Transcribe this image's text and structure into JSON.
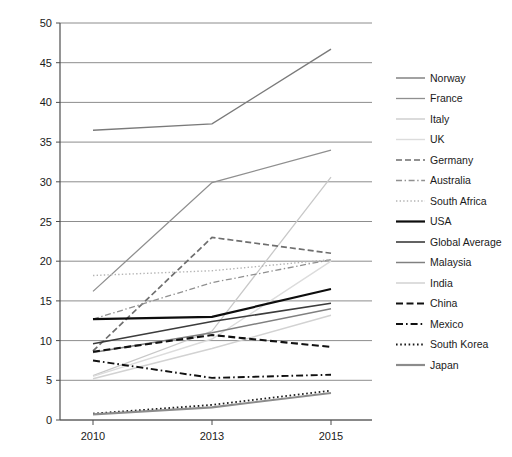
{
  "chart_data": {
    "type": "line",
    "title": "",
    "xlabel": "",
    "ylabel": "",
    "categories": [
      "2010",
      "2013",
      "2015"
    ],
    "x": [
      2010,
      2013,
      2015
    ],
    "ylim": [
      0,
      50
    ],
    "yticks": [
      0,
      5,
      10,
      15,
      20,
      25,
      30,
      35,
      40,
      45,
      50
    ],
    "ytick_labels": [
      "0",
      "5",
      "10",
      "15",
      "20",
      "25",
      "30",
      "35",
      "40",
      "45",
      "50"
    ],
    "xtick_labels": [
      "2010",
      "2013",
      "2015"
    ],
    "grid": "horizontal",
    "legend_position": "right",
    "series": [
      {
        "name": "Norway",
        "values": [
          36.5,
          37.3,
          46.7
        ],
        "color": "#7a7a7a",
        "style": "solid",
        "width": 1.4
      },
      {
        "name": "France",
        "values": [
          16.2,
          29.9,
          34.0
        ],
        "color": "#8f8f8f",
        "style": "solid",
        "width": 1.3
      },
      {
        "name": "Italy",
        "values": [
          5.6,
          11.2,
          30.6
        ],
        "color": "#c8c8c8",
        "style": "solid",
        "width": 1.3
      },
      {
        "name": "UK",
        "values": [
          5.5,
          10.2,
          20.0
        ],
        "color": "#dcdcdc",
        "style": "solid",
        "width": 1.4
      },
      {
        "name": "Germany",
        "values": [
          8.7,
          23.0,
          21.0
        ],
        "color": "#6e6e6e",
        "style": "dashed",
        "width": 1.7
      },
      {
        "name": "Australia",
        "values": [
          12.7,
          17.3,
          20.2
        ],
        "color": "#909090",
        "style": "dashdot",
        "width": 1.3
      },
      {
        "name": "South Africa",
        "values": [
          18.2,
          18.8,
          20.2
        ],
        "color": "#b4b4b4",
        "style": "dotted",
        "width": 1.4
      },
      {
        "name": "USA",
        "values": [
          12.7,
          13.0,
          16.5
        ],
        "color": "#0d0d0d",
        "style": "solid",
        "width": 2.2
      },
      {
        "name": "Global Average",
        "values": [
          9.6,
          12.4,
          14.7
        ],
        "color": "#3c3c3c",
        "style": "solid",
        "width": 1.6
      },
      {
        "name": "Malaysia",
        "values": [
          8.5,
          11.0,
          14.0
        ],
        "color": "#808080",
        "style": "solid",
        "width": 1.5
      },
      {
        "name": "India",
        "values": [
          5.2,
          9.0,
          13.2
        ],
        "color": "#d2d2d2",
        "style": "solid",
        "width": 1.5
      },
      {
        "name": "China",
        "values": [
          8.6,
          10.7,
          9.2
        ],
        "color": "#111111",
        "style": "dashed",
        "width": 2.1
      },
      {
        "name": "Mexico",
        "values": [
          7.5,
          5.3,
          5.7
        ],
        "color": "#111111",
        "style": "dashdot",
        "width": 1.9
      },
      {
        "name": "South Korea",
        "values": [
          0.8,
          1.9,
          3.7
        ],
        "color": "#1a1a1a",
        "style": "dotted",
        "width": 1.9
      },
      {
        "name": "Japan",
        "values": [
          0.7,
          1.6,
          3.4
        ],
        "color": "#8c8c8c",
        "style": "solid",
        "width": 2.2
      }
    ]
  },
  "legend": {
    "items": [
      "Norway",
      "France",
      "Italy",
      "UK",
      "Germany",
      "Australia",
      "South Africa",
      "USA",
      "Global Average",
      "Malaysia",
      "India",
      "China",
      "Mexico",
      "South Korea",
      "Japan"
    ]
  },
  "axes": {
    "y_tick_labels": [
      "50",
      "45",
      "40",
      "35",
      "30",
      "25",
      "20",
      "15",
      "10",
      "5",
      "0"
    ],
    "x_tick_labels": [
      "2010",
      "2013",
      "2015"
    ]
  },
  "colors": {
    "background": "#ffffff",
    "gridline": "#808080",
    "axis": "#4d4d4d",
    "text": "#1a1a1a"
  }
}
